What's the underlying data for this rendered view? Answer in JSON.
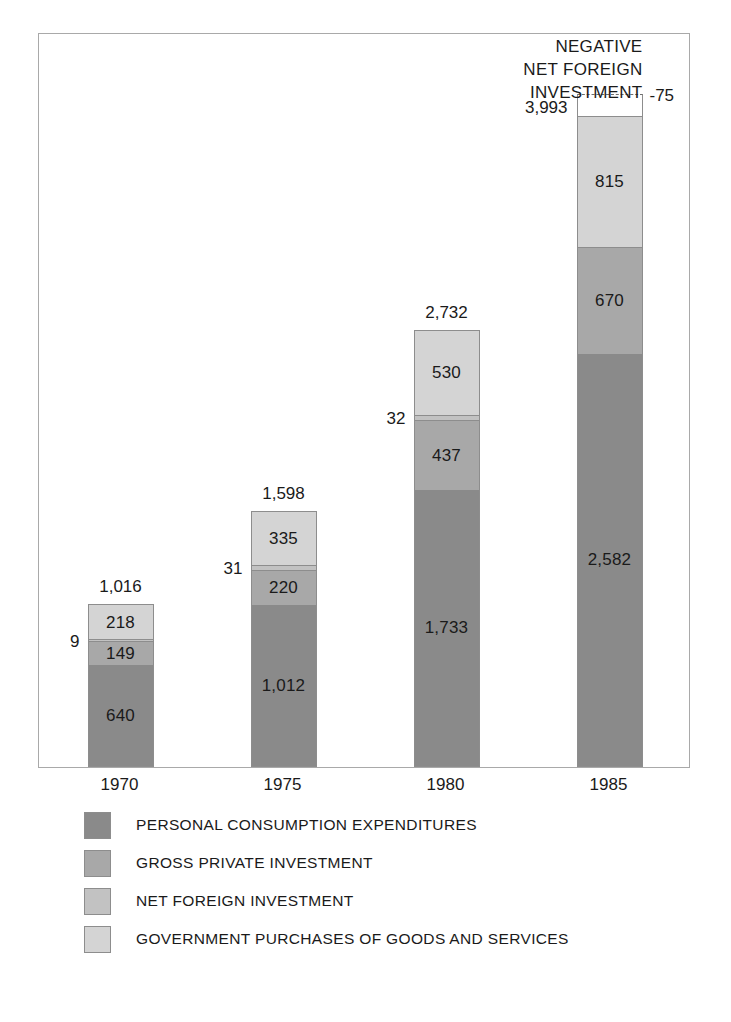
{
  "chart_data": {
    "type": "bar",
    "subtype": "stacked-bar",
    "title": "",
    "xlabel": "",
    "ylabel": "",
    "grid": false,
    "legend_position": "bottom-left",
    "ylim": [
      0,
      3993
    ],
    "categories": [
      "1970",
      "1975",
      "1980",
      "1985"
    ],
    "series": [
      {
        "name": "PERSONAL CONSUMPTION EXPENDITURES",
        "color": "#8a8a8a",
        "values": [
          640,
          1012,
          1733,
          2582
        ],
        "labels": [
          "640",
          "1,012",
          "1,733",
          "2,582"
        ]
      },
      {
        "name": "GROSS PRIVATE INVESTMENT",
        "color": "#a8a8a8",
        "values": [
          149,
          220,
          437,
          670
        ],
        "labels": [
          "149",
          "220",
          "437",
          "670"
        ]
      },
      {
        "name": "NET FOREIGN INVESTMENT",
        "color": "#c2c2c2",
        "values": [
          9,
          31,
          32,
          -75
        ],
        "labels": [
          "9",
          "31",
          "32",
          "-75"
        ]
      },
      {
        "name": "GOVERNMENT PURCHASES OF GOODS AND SERVICES",
        "color": "#d4d4d4",
        "values": [
          218,
          335,
          530,
          815
        ],
        "labels": [
          "218",
          "335",
          "530",
          "815"
        ]
      }
    ],
    "totals": [
      1016,
      1598,
      2732,
      3993
    ],
    "total_labels": [
      "1,016",
      "1,598",
      "2,732",
      "3,993"
    ],
    "annotations": [
      {
        "text": "NEGATIVE NET FOREIGN INVESTMENT",
        "lines": [
          "NEGATIVE",
          "NET FOREIGN",
          "INVESTMENT"
        ],
        "target_category": "1985",
        "target_value": -75
      }
    ]
  },
  "bars": [
    {
      "year": "1970",
      "total_label": "1,016",
      "total_position": "centered",
      "segments": [
        {
          "label": "640",
          "value": 640,
          "tone": "tone-1",
          "inline": true
        },
        {
          "label": "149",
          "value": 149,
          "tone": "tone-2",
          "inline": true
        },
        {
          "label": "9",
          "value": 9,
          "tone": "tone-3",
          "inline": false,
          "side": "left"
        },
        {
          "label": "218",
          "value": 218,
          "tone": "tone-4",
          "inline": true
        }
      ]
    },
    {
      "year": "1975",
      "total_label": "1,598",
      "total_position": "centered",
      "segments": [
        {
          "label": "1,012",
          "value": 1012,
          "tone": "tone-1",
          "inline": true
        },
        {
          "label": "220",
          "value": 220,
          "tone": "tone-2",
          "inline": true
        },
        {
          "label": "31",
          "value": 31,
          "tone": "tone-3",
          "inline": false,
          "side": "left"
        },
        {
          "label": "335",
          "value": 335,
          "tone": "tone-4",
          "inline": true
        }
      ]
    },
    {
      "year": "1980",
      "total_label": "2,732",
      "total_position": "centered",
      "segments": [
        {
          "label": "1,733",
          "value": 1733,
          "tone": "tone-1",
          "inline": true
        },
        {
          "label": "437",
          "value": 437,
          "tone": "tone-2",
          "inline": true
        },
        {
          "label": "32",
          "value": 32,
          "tone": "tone-3",
          "inline": false,
          "side": "left"
        },
        {
          "label": "530",
          "value": 530,
          "tone": "tone-4",
          "inline": true
        }
      ]
    },
    {
      "year": "1985",
      "total_label": "3,993",
      "total_position": "left",
      "segments": [
        {
          "label": "2,582",
          "value": 2582,
          "tone": "tone-1",
          "inline": true
        },
        {
          "label": "670",
          "value": 670,
          "tone": "tone-2",
          "inline": true
        },
        {
          "label": "815",
          "value": 815,
          "tone": "tone-4",
          "inline": true
        },
        {
          "label": "-75",
          "value": -75,
          "tone": "negative",
          "inline": false,
          "side": "right"
        }
      ]
    }
  ],
  "annotation": {
    "line1": "NEGATIVE",
    "line2": "NET FOREIGN",
    "line3": "INVESTMENT"
  },
  "x_axis": {
    "ticks": [
      "1970",
      "1975",
      "1980",
      "1985"
    ]
  },
  "legend": {
    "items": [
      {
        "label": "PERSONAL CONSUMPTION EXPENDITURES",
        "color": "#8a8a8a"
      },
      {
        "label": "GROSS PRIVATE INVESTMENT",
        "color": "#a8a8a8"
      },
      {
        "label": "NET FOREIGN INVESTMENT",
        "color": "#c2c2c2"
      },
      {
        "label": "GOVERNMENT PURCHASES OF GOODS AND SERVICES",
        "color": "#d4d4d4"
      }
    ]
  },
  "colors": {
    "tone_1": "#8a8a8a",
    "tone_2": "#a8a8a8",
    "tone_3": "#c2c2c2",
    "tone_4": "#d4d4d4",
    "frame": "#a9a9a9",
    "segment_border": "#8d8d8d",
    "text": "#1a1a1a",
    "background": "#ffffff"
  }
}
